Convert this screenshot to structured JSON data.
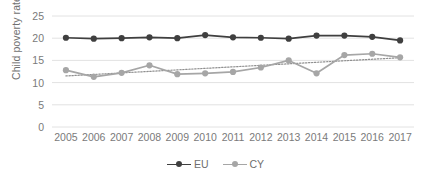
{
  "chart_data": {
    "type": "line",
    "title": "",
    "xlabel": "",
    "ylabel": "Child poverty rate",
    "categories": [
      "2005",
      "2006",
      "2007",
      "2008",
      "2009",
      "2010",
      "2011",
      "2012",
      "2013",
      "2014",
      "2015",
      "2016",
      "2017"
    ],
    "ylim": [
      0,
      25
    ],
    "yticks": [
      0,
      5,
      10,
      15,
      20,
      25
    ],
    "grid": true,
    "legend_position": "bottom-center",
    "series": [
      {
        "name": "EU",
        "color": "#3f3f3f",
        "marker": "circle",
        "values": [
          20.1,
          19.9,
          20.0,
          20.2,
          20.0,
          20.7,
          20.2,
          20.1,
          19.9,
          20.6,
          20.6,
          20.3,
          19.5
        ]
      },
      {
        "name": "CY",
        "color": "#a6a6a6",
        "marker": "circle",
        "values": [
          12.8,
          11.3,
          12.2,
          13.9,
          11.9,
          12.1,
          12.4,
          13.4,
          15.0,
          12.1,
          16.2,
          16.5,
          15.7
        ]
      }
    ],
    "trendlines": [
      {
        "name": "CY trendline",
        "style": "dotted",
        "color": "#8f8f8f",
        "for_series": "CY",
        "start_value": 11.5,
        "end_value": 15.6
      }
    ]
  },
  "axis": {
    "ylabel": "Child poverty rate",
    "yticks": [
      "25",
      "20",
      "15",
      "10",
      "5",
      "0"
    ],
    "xticks": [
      "2005",
      "2006",
      "2007",
      "2008",
      "2009",
      "2010",
      "2011",
      "2012",
      "2013",
      "2014",
      "2015",
      "2016",
      "2017"
    ]
  },
  "legend": {
    "items": [
      {
        "label": "EU"
      },
      {
        "label": "CY"
      }
    ]
  }
}
